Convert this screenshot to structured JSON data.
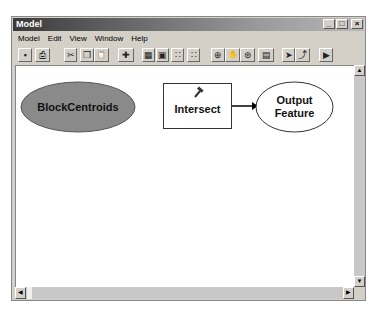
{
  "window": {
    "title": "Model",
    "controls": [
      "_",
      "□",
      "×"
    ]
  },
  "menu": [
    "Model",
    "Edit",
    "View",
    "Window",
    "Help"
  ],
  "toolbar": [
    {
      "name": "save-icon",
      "glyph": "▪"
    },
    {
      "name": "print-icon",
      "glyph": "⎙"
    },
    {
      "name": "cut-icon",
      "glyph": "✂"
    },
    {
      "name": "copy-icon",
      "glyph": "❐"
    },
    {
      "name": "paste-icon",
      "glyph": "📋"
    },
    {
      "name": "add-data-icon",
      "glyph": "✚"
    },
    {
      "name": "layout-grid-icon",
      "glyph": "▦"
    },
    {
      "name": "layout-full-icon",
      "glyph": "▣"
    },
    {
      "name": "layout-dots-icon",
      "glyph": "∷"
    },
    {
      "name": "layout-dots2-icon",
      "glyph": "∷"
    },
    {
      "name": "zoom-in-icon",
      "glyph": "⊕"
    },
    {
      "name": "pan-icon",
      "glyph": "✋"
    },
    {
      "name": "zoom-full-icon",
      "glyph": "⊛"
    },
    {
      "name": "properties-icon",
      "glyph": "▤"
    },
    {
      "name": "select-icon",
      "glyph": "➤"
    },
    {
      "name": "connect-icon",
      "glyph": "⤴"
    },
    {
      "name": "run-icon",
      "glyph": "▶"
    }
  ],
  "diagram": {
    "input": "BlockCentroids",
    "tool": "Intersect",
    "output_line1": "Output",
    "output_line2": "Feature"
  },
  "scroll": {
    "up": "▲",
    "down": "▼",
    "left": "◀",
    "right": "▶"
  }
}
